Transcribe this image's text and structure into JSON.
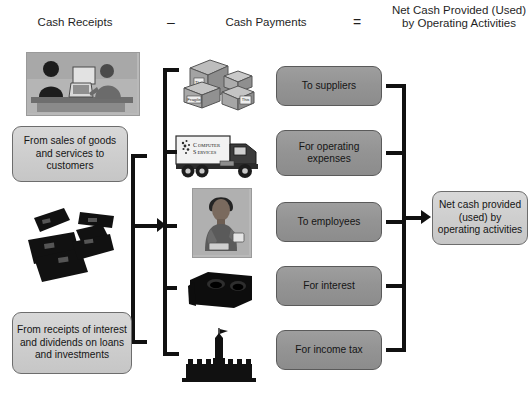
{
  "diagram": {
    "headers": {
      "receipts": "Cash Receipts",
      "minus": "–",
      "payments": "Cash Payments",
      "equals": "=",
      "net": "Net Cash Provided (Used) by Operating Activities"
    },
    "receipts_boxes": [
      {
        "id": "from-sales",
        "label": "From sales of goods and services to customers"
      },
      {
        "id": "from-receipts",
        "label": "From receipts of interest and dividends on loans and investments"
      }
    ],
    "payment_boxes": [
      {
        "id": "to-suppliers",
        "label": "To suppliers"
      },
      {
        "id": "for-operating-expenses",
        "label": "For operating expenses"
      },
      {
        "id": "to-employees",
        "label": "To employees"
      },
      {
        "id": "for-interest",
        "label": "For interest"
      },
      {
        "id": "for-income-tax",
        "label": "For income tax"
      }
    ],
    "result_box": {
      "id": "net-cash",
      "label": "Net cash provided (used) by operating activities"
    },
    "illustrations": [
      {
        "id": "store-counter-photo",
        "name": "retail-sale-photo",
        "alt": "People at a sales counter with a computer"
      },
      {
        "id": "cash-bundles",
        "name": "cash-bundles-illustration",
        "alt": "Bundles of cash"
      },
      {
        "id": "shipping-boxes",
        "name": "shipping-boxes-illustration",
        "alt": "Stacked cartons labeled This Side Up and Fragile",
        "box_labels": [
          "This Side Up",
          "Fragile",
          "This Side Up"
        ]
      },
      {
        "id": "service-truck",
        "name": "service-truck-illustration",
        "alt": "Delivery truck",
        "truck_text": "COMPUTER SERVICES"
      },
      {
        "id": "employee",
        "name": "employee-photo",
        "alt": "Employee holding a cup"
      },
      {
        "id": "cash-box",
        "name": "cash-box-illustration",
        "alt": "Cash box / strongbox"
      },
      {
        "id": "government-building",
        "name": "government-building-illustration",
        "alt": "Government building with flag"
      }
    ],
    "colors": {
      "box_light": "#cfcfcf",
      "box_dark": "#949494",
      "line": "#111111",
      "text": "#1a1a1a"
    }
  }
}
